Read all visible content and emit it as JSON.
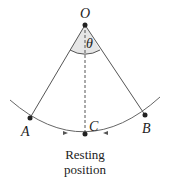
{
  "diagram": {
    "points": {
      "O": {
        "label": "O",
        "x": 85,
        "y": 25
      },
      "A": {
        "label": "A",
        "x": 30,
        "y": 118
      },
      "B": {
        "label": "B",
        "x": 145,
        "y": 115
      },
      "C": {
        "label": "C",
        "x": 85,
        "y": 134
      }
    },
    "angle_label": "θ",
    "caption_line1": "Resting",
    "caption_line2": "position",
    "colors": {
      "line": "#555555",
      "point": "#222222",
      "angle_fill": "#e6e6e6"
    }
  }
}
